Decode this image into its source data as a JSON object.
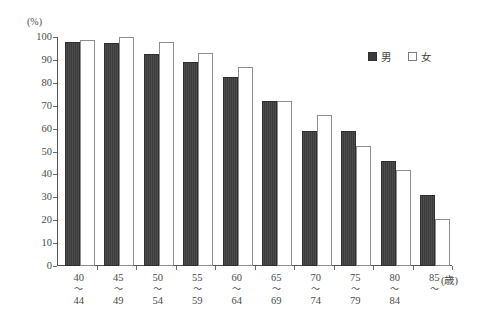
{
  "chart_data": {
    "type": "bar",
    "title": "",
    "subtitle": "",
    "xlabel": "(歳)",
    "ylabel": "(%)",
    "ylim": [
      0,
      100
    ],
    "yticks": [
      0,
      10,
      20,
      30,
      40,
      50,
      60,
      70,
      80,
      90,
      100
    ],
    "grid": false,
    "legend_position": "top-right",
    "categories": [
      {
        "lo": "40",
        "sep": "〜",
        "hi": "44"
      },
      {
        "lo": "45",
        "sep": "〜",
        "hi": "49"
      },
      {
        "lo": "50",
        "sep": "〜",
        "hi": "54"
      },
      {
        "lo": "55",
        "sep": "〜",
        "hi": "59"
      },
      {
        "lo": "60",
        "sep": "〜",
        "hi": "64"
      },
      {
        "lo": "65",
        "sep": "〜",
        "hi": "69"
      },
      {
        "lo": "70",
        "sep": "〜",
        "hi": "74"
      },
      {
        "lo": "75",
        "sep": "〜",
        "hi": "79"
      },
      {
        "lo": "80",
        "sep": "〜",
        "hi": "84"
      },
      {
        "lo": "85",
        "sep": "〜",
        "hi": ""
      }
    ],
    "series": [
      {
        "name": "男",
        "key": "male",
        "color": "#3b3b3b",
        "values": [
          98,
          97.5,
          92.5,
          89,
          82.5,
          72,
          59,
          59,
          46,
          31
        ]
      },
      {
        "name": "女",
        "key": "female",
        "color": "#ffffff",
        "values": [
          98.5,
          100,
          98,
          93,
          87,
          72,
          66,
          52.5,
          42,
          20.5
        ]
      }
    ]
  },
  "legend": {
    "items": [
      {
        "label": "男",
        "swatch": "filled-square"
      },
      {
        "label": "女",
        "swatch": "open-square"
      }
    ]
  },
  "axes": {
    "y_unit": "(%)",
    "x_unit": "(歳)"
  }
}
